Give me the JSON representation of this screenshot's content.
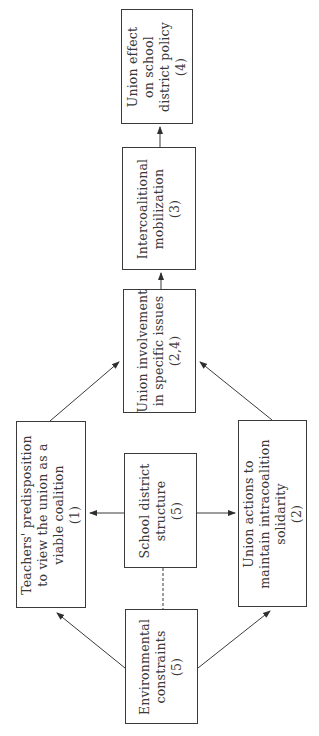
{
  "diagram": {
    "orientation": "rotated-90-ccw",
    "nodes": {
      "env": {
        "lines": [
          "Environmental",
          "constraints",
          "(5)"
        ]
      },
      "school": {
        "lines": [
          "School district",
          "structure",
          "(5)"
        ]
      },
      "teachers": {
        "lines": [
          "Teachers' predisposition",
          "to view the union as a",
          "viable coalition",
          "(1)"
        ]
      },
      "actions": {
        "lines": [
          "Union actions to",
          "maintain intracoalition",
          "solidarity",
          "(2)"
        ]
      },
      "involvement": {
        "lines": [
          "Union involvement",
          "in specific issues",
          "(2,4)"
        ]
      },
      "mobilization": {
        "lines": [
          "Intercoalitional",
          "mobilization",
          "(3)"
        ]
      },
      "effect": {
        "lines": [
          "Union effect",
          "on school",
          "district policy",
          "(4)"
        ]
      }
    },
    "edges": [
      {
        "from": "env",
        "to": "teachers",
        "style": "arrow"
      },
      {
        "from": "env",
        "to": "actions",
        "style": "arrow"
      },
      {
        "from": "env",
        "to": "school",
        "style": "dashed"
      },
      {
        "from": "school",
        "to": "teachers",
        "style": "arrow"
      },
      {
        "from": "school",
        "to": "actions",
        "style": "arrow"
      },
      {
        "from": "teachers",
        "to": "involvement",
        "style": "arrow"
      },
      {
        "from": "actions",
        "to": "involvement",
        "style": "arrow"
      },
      {
        "from": "involvement",
        "to": "mobilization",
        "style": "arrow"
      },
      {
        "from": "mobilization",
        "to": "effect",
        "style": "arrow"
      }
    ]
  }
}
